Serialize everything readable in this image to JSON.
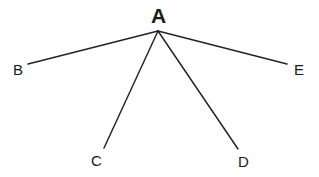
{
  "diagram": {
    "type": "node-link-star",
    "background_color": "#ffffff",
    "line_color": "#232323",
    "text_color": "#1a1a1a",
    "root": {
      "id": "A",
      "label": "A",
      "bold": true,
      "x": 158,
      "y": 31
    },
    "leaves": [
      {
        "id": "B",
        "label": "B",
        "x": 28,
        "y": 64,
        "edge_from": "A"
      },
      {
        "id": "C",
        "label": "C",
        "x": 104,
        "y": 148,
        "edge_from": "A"
      },
      {
        "id": "D",
        "label": "D",
        "x": 238,
        "y": 149,
        "edge_from": "A"
      },
      {
        "id": "E",
        "label": "E",
        "x": 287,
        "y": 64,
        "edge_from": "A"
      }
    ],
    "edges": [
      {
        "name": "edge-a-b",
        "from": "A",
        "to": "B",
        "x1": 158,
        "y1": 31,
        "x2": 28,
        "y2": 64
      },
      {
        "name": "edge-a-c",
        "from": "A",
        "to": "C",
        "x1": 158,
        "y1": 31,
        "x2": 104,
        "y2": 148
      },
      {
        "name": "edge-a-d",
        "from": "A",
        "to": "D",
        "x1": 158,
        "y1": 31,
        "x2": 238,
        "y2": 149
      },
      {
        "name": "edge-a-e",
        "from": "A",
        "to": "E",
        "x1": 158,
        "y1": 31,
        "x2": 287,
        "y2": 64
      }
    ]
  }
}
